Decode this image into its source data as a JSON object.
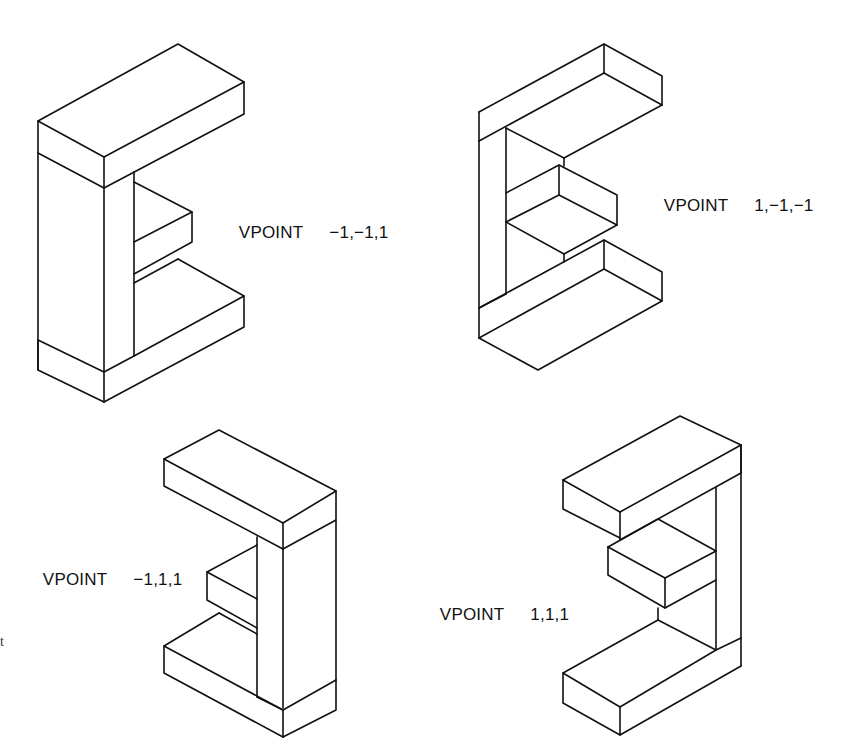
{
  "figure": {
    "line_color": "#111111",
    "background": "#ffffff"
  },
  "views": [
    {
      "id": "view-1",
      "command": "VPOINT",
      "coords": "−1,−1,1",
      "position": "top-left"
    },
    {
      "id": "view-2",
      "command": "VPOINT",
      "coords": "1,−1,−1",
      "position": "top-right"
    },
    {
      "id": "view-3",
      "command": "VPOINT",
      "coords": "−1,1,1",
      "position": "bottom-left"
    },
    {
      "id": "view-4",
      "command": "VPOINT",
      "coords": "1,1,1",
      "position": "bottom-right"
    }
  ],
  "margin_glyph": "t"
}
